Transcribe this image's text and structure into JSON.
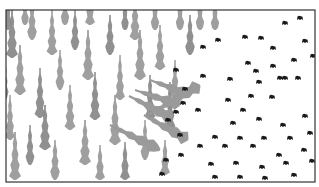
{
  "illustration": {
    "subject": "deforestation",
    "frame": {
      "x": 6,
      "y": 10,
      "w": 309,
      "h": 172,
      "stroke": "#333333"
    },
    "colors": {
      "tree": "#9a9a9a",
      "tree_dark": "#8a8a8a",
      "stump": "#1a1a1a",
      "background": "#ffffff"
    },
    "standing_trees": [
      [
        12,
        58,
        12,
        48
      ],
      [
        32,
        40,
        11,
        40
      ],
      [
        20,
        95,
        12,
        50
      ],
      [
        40,
        118,
        11,
        50
      ],
      [
        10,
        140,
        10,
        45
      ],
      [
        15,
        180,
        12,
        48
      ],
      [
        30,
        165,
        10,
        40
      ],
      [
        52,
        55,
        11,
        45
      ],
      [
        60,
        90,
        10,
        40
      ],
      [
        45,
        150,
        12,
        45
      ],
      [
        55,
        180,
        11,
        40
      ],
      [
        70,
        130,
        11,
        45
      ],
      [
        75,
        50,
        10,
        40
      ],
      [
        90,
        25,
        10,
        35
      ],
      [
        88,
        80,
        12,
        50
      ],
      [
        95,
        120,
        11,
        48
      ],
      [
        85,
        165,
        12,
        45
      ],
      [
        100,
        180,
        10,
        35
      ],
      [
        110,
        55,
        11,
        40
      ],
      [
        120,
        100,
        10,
        45
      ],
      [
        115,
        145,
        12,
        50
      ],
      [
        125,
        180,
        10,
        38
      ],
      [
        135,
        40,
        11,
        45
      ],
      [
        140,
        80,
        12,
        50
      ],
      [
        150,
        120,
        11,
        45
      ],
      [
        145,
        160,
        10,
        40
      ],
      [
        160,
        70,
        11,
        45
      ],
      [
        170,
        130,
        11,
        48
      ],
      [
        165,
        175,
        10,
        35
      ],
      [
        180,
        30,
        10,
        30
      ],
      [
        190,
        55,
        11,
        40
      ],
      [
        200,
        30,
        10,
        30
      ],
      [
        215,
        30,
        10,
        28
      ],
      [
        8,
        30,
        9,
        30
      ],
      [
        25,
        25,
        9,
        28
      ],
      [
        65,
        25,
        10,
        32
      ],
      [
        125,
        30,
        9,
        28
      ],
      [
        155,
        30,
        10,
        30
      ],
      [
        175,
        100,
        10,
        40
      ],
      [
        5,
        100,
        8,
        40
      ]
    ],
    "fallen_trees": [
      [
        252,
        55,
        200,
        85,
        9
      ],
      [
        225,
        120,
        180,
        105,
        8
      ],
      [
        230,
        110,
        190,
        95,
        8
      ],
      [
        215,
        140,
        172,
        118,
        9
      ],
      [
        232,
        165,
        188,
        140,
        9
      ],
      [
        210,
        175,
        160,
        150,
        9
      ]
    ],
    "stumps": [
      [
        218,
        40
      ],
      [
        245,
        37
      ],
      [
        261,
        38
      ],
      [
        285,
        23
      ],
      [
        300,
        18
      ],
      [
        248,
        63
      ],
      [
        273,
        66
      ],
      [
        294,
        60
      ],
      [
        305,
        41
      ],
      [
        273,
        48
      ],
      [
        256,
        71
      ],
      [
        203,
        47
      ],
      [
        230,
        79
      ],
      [
        259,
        82
      ],
      [
        280,
        78
      ],
      [
        298,
        78
      ],
      [
        313,
        56
      ],
      [
        251,
        96
      ],
      [
        272,
        97
      ],
      [
        285,
        78
      ],
      [
        228,
        100
      ],
      [
        203,
        76
      ],
      [
        176,
        70
      ],
      [
        185,
        89
      ],
      [
        198,
        110
      ],
      [
        233,
        123
      ],
      [
        243,
        110
      ],
      [
        259,
        119
      ],
      [
        283,
        125
      ],
      [
        305,
        116
      ],
      [
        215,
        137
      ],
      [
        240,
        138
      ],
      [
        264,
        138
      ],
      [
        290,
        138
      ],
      [
        310,
        133
      ],
      [
        200,
        146
      ],
      [
        225,
        146
      ],
      [
        253,
        146
      ],
      [
        279,
        155
      ],
      [
        304,
        150
      ],
      [
        181,
        155
      ],
      [
        211,
        164
      ],
      [
        236,
        163
      ],
      [
        262,
        167
      ],
      [
        286,
        163
      ],
      [
        312,
        161
      ],
      [
        180,
        135
      ],
      [
        215,
        177
      ],
      [
        240,
        177
      ],
      [
        265,
        178
      ],
      [
        294,
        175
      ],
      [
        162,
        174
      ],
      [
        193,
        185
      ],
      [
        168,
        120
      ],
      [
        183,
        103
      ],
      [
        176,
        112
      ],
      [
        166,
        160
      ]
    ]
  }
}
